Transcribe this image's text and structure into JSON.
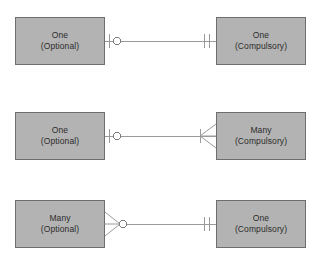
{
  "diagram": {
    "background_color": "#ffffff",
    "box_fill_color": "#b3b3b3",
    "box_border_color": "#6e6e6e",
    "line_color": "#9a9a9a",
    "text_color": "#2b2b2b",
    "rows": [
      {
        "id": "row-1",
        "left_entity": {
          "line1": "One",
          "line2": "(Optional)"
        },
        "right_entity": {
          "line1": "One",
          "line2": "(Compulsory)"
        },
        "left_symbol": "zero-or-one",
        "right_symbol": "exactly-one"
      },
      {
        "id": "row-2",
        "left_entity": {
          "line1": "One",
          "line2": "(Optional)"
        },
        "right_entity": {
          "line1": "Many",
          "line2": "(Compulsory)"
        },
        "left_symbol": "zero-or-one",
        "right_symbol": "one-or-many"
      },
      {
        "id": "row-3",
        "left_entity": {
          "line1": "Many",
          "line2": "(Optional)"
        },
        "right_entity": {
          "line1": "One",
          "line2": "(Compulsory)"
        },
        "left_symbol": "zero-or-many",
        "right_symbol": "exactly-one"
      }
    ]
  }
}
